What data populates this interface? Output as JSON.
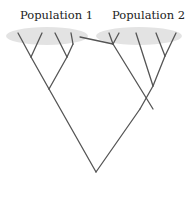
{
  "diagram": {
    "type": "phylogenetic-tree",
    "labels": {
      "population_1": "Population 1",
      "population_2": "Population 2"
    },
    "colors": {
      "ellipse": "#e3e3e3",
      "line": "#555555",
      "text": "#222222"
    }
  }
}
